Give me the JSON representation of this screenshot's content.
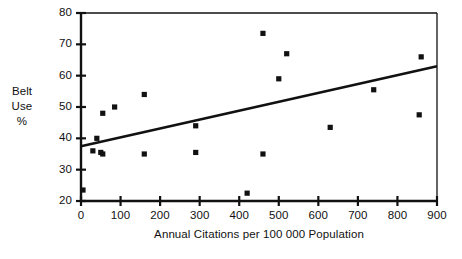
{
  "chart_data": {
    "type": "scatter",
    "title": "",
    "xlabel": "Annual Citations per 100 000 Population",
    "ylabel": "Belt Use %",
    "ylabel_lines": [
      "Belt",
      "Use",
      "%"
    ],
    "xlim": [
      0,
      900
    ],
    "ylim": [
      20,
      80
    ],
    "xticks": [
      0,
      100,
      200,
      300,
      400,
      500,
      600,
      700,
      800,
      900
    ],
    "yticks": [
      20,
      30,
      40,
      50,
      60,
      70,
      80
    ],
    "xtick_labels": [
      "0",
      "100",
      "200",
      "300",
      "400",
      "500",
      "600",
      "700",
      "800",
      "900"
    ],
    "ytick_labels": [
      "20",
      "30",
      "40",
      "50",
      "60",
      "70",
      "80"
    ],
    "grid": false,
    "legend": "none",
    "marker": "filled-square",
    "marker_color": "#111111",
    "axis_color": "#111111",
    "background_color": "#ffffff",
    "points": [
      {
        "x": 5,
        "y": 23.5
      },
      {
        "x": 30,
        "y": 36.0
      },
      {
        "x": 40,
        "y": 40.0
      },
      {
        "x": 50,
        "y": 35.5
      },
      {
        "x": 55,
        "y": 35.0
      },
      {
        "x": 55,
        "y": 48.0
      },
      {
        "x": 85,
        "y": 50.0
      },
      {
        "x": 160,
        "y": 54.0
      },
      {
        "x": 160,
        "y": 35.0
      },
      {
        "x": 290,
        "y": 44.0
      },
      {
        "x": 290,
        "y": 35.5
      },
      {
        "x": 420,
        "y": 22.5
      },
      {
        "x": 460,
        "y": 73.5
      },
      {
        "x": 460,
        "y": 35.0
      },
      {
        "x": 500,
        "y": 59.0
      },
      {
        "x": 520,
        "y": 67.0
      },
      {
        "x": 630,
        "y": 43.5
      },
      {
        "x": 740,
        "y": 55.5
      },
      {
        "x": 855,
        "y": 47.5
      },
      {
        "x": 860,
        "y": 66.0
      }
    ],
    "trendline": {
      "type": "linear-fit",
      "x0": 0,
      "y0": 37.5,
      "x1": 900,
      "y1": 63.0,
      "color": "#111111"
    }
  }
}
